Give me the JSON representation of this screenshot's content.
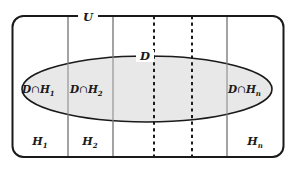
{
  "diagram": {
    "type": "venn-partition-diagram",
    "title_label": "U",
    "set_label": "D",
    "universe": {
      "name": "U",
      "description": "Universal set drawn as a rounded rectangle"
    },
    "ellipse": {
      "name": "D",
      "fill_color": "#e8e8e8",
      "stroke_color": "#1a1a1a"
    },
    "colors": {
      "outer_border": "#1a1a1a",
      "divider_solid": "#808080",
      "divider_dotted": "#1a1a1a",
      "ellipse_fill": "#e8e8e8",
      "ellipse_stroke": "#1a1a1a",
      "text": "#1a1a1a",
      "background": "#ffffff"
    },
    "cells": [
      {
        "id": "cell-1",
        "label_base": "H",
        "label_sub": "1",
        "bottom_label": "H₁"
      },
      {
        "id": "cell-2",
        "label_base": "H",
        "label_sub": "2",
        "bottom_label": "H₂"
      },
      {
        "id": "cell-n",
        "label_base": "H",
        "label_sub": "n",
        "bottom_label": "Hₙ"
      }
    ],
    "intersections": [
      {
        "id": "inter-1",
        "prefix": "D",
        "operator": "∩",
        "base": "H",
        "sub": "1",
        "full": "D∩H₁"
      },
      {
        "id": "inter-2",
        "prefix": "D",
        "operator": "∩",
        "base": "H",
        "sub": "2",
        "full": "D∩H₂"
      },
      {
        "id": "inter-n",
        "prefix": "D",
        "operator": "∩",
        "base": "H",
        "sub": "n",
        "full": "D∩Hₙ"
      }
    ],
    "dividers": {
      "solid_positions": [
        68,
        113,
        227
      ],
      "dotted_positions": [
        154,
        192
      ],
      "ellipsis_meaning": "continuation of partition cells"
    }
  }
}
